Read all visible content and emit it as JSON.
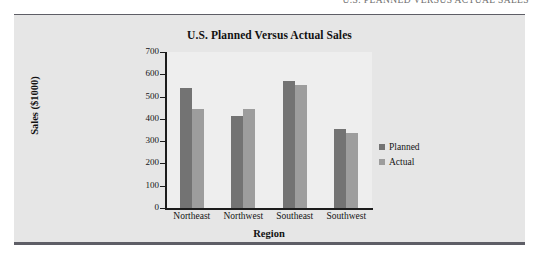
{
  "running_header": {
    "text": "U.S. PLANNED VERSUS ACTUAL SALES"
  },
  "figure": {
    "title": "U.S. Planned Versus Actual Sales",
    "xlabel": "Region",
    "ylabel": "Sales ($1000)"
  },
  "legend": {
    "position": "right",
    "items": [
      {
        "label": "Planned",
        "color": "#737373"
      },
      {
        "label": "Actual",
        "color": "#9d9d9d"
      }
    ]
  },
  "chart_data": {
    "type": "bar",
    "title": "U.S. Planned Versus Actual Sales",
    "xlabel": "Region",
    "ylabel": "Sales ($1000)",
    "categories": [
      "Northeast",
      "Northwest",
      "Southeast",
      "Southwest"
    ],
    "series": [
      {
        "name": "Planned",
        "color": "#737373",
        "values": [
          540,
          415,
          570,
          355
        ]
      },
      {
        "name": "Actual",
        "color": "#9d9d9d",
        "values": [
          445,
          445,
          550,
          335
        ]
      }
    ],
    "ylim": [
      0,
      700
    ],
    "yticks": [
      0,
      100,
      200,
      300,
      400,
      500,
      600,
      700
    ],
    "ytick_labels": [
      "0",
      "100",
      "200",
      "300",
      "400",
      "500",
      "600",
      "700"
    ],
    "grid": false,
    "legend_position": "right"
  }
}
